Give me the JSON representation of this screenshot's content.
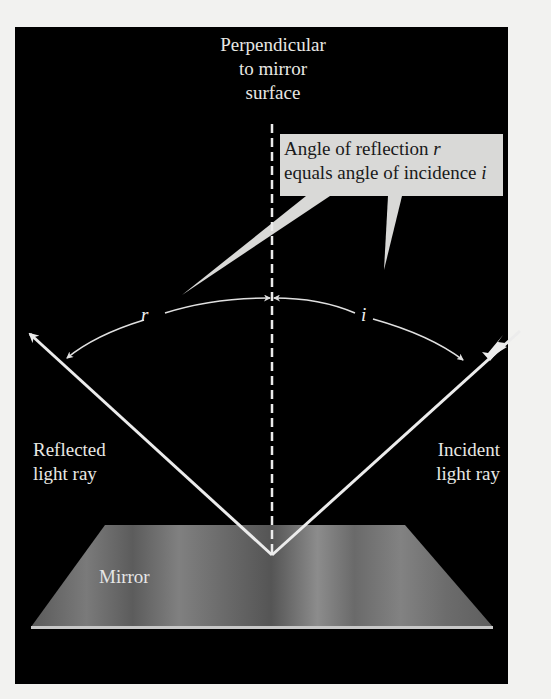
{
  "diagram": {
    "labels": {
      "perpendicular": "Perpendicular\nto mirror\nsurface",
      "callout_line1": "Angle of reflection ",
      "callout_var1": "r",
      "callout_line2": "equals angle of incidence ",
      "callout_var2": "i",
      "angle_reflection": "r",
      "angle_incidence": "i",
      "reflected_ray": "Reflected\nlight ray",
      "incident_ray": "Incident\nlight ray",
      "mirror": "Mirror"
    },
    "colors": {
      "background": "#000000",
      "page": "#f2f2f0",
      "ray": "#ececec",
      "callout_fill": "#d9d9d7",
      "mirror_fill": "#6e6e6e",
      "mirror_edge": "#c8c8c8",
      "text_light": "#e8e8e4",
      "text_dark": "#1a1a1a"
    },
    "geometry": {
      "reflection_point": [
        272,
        555
      ],
      "reflected_ray_end": [
        28,
        332
      ],
      "incident_ray_start": [
        520,
        330
      ],
      "normal_x": 272,
      "normal_y_range": [
        124,
        555
      ]
    }
  }
}
